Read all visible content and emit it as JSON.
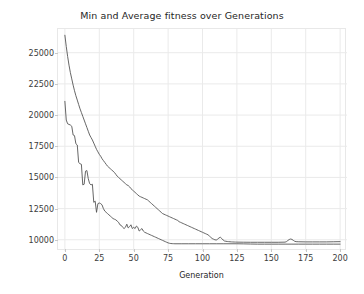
{
  "chart_data": {
    "type": "line",
    "title": "Min and Average fitness over Generations",
    "xlabel": "Generation",
    "ylabel": "Min / Average Fitness",
    "xlim": [
      -5,
      205
    ],
    "ylim": [
      9100,
      26900
    ],
    "xticks": [
      0,
      25,
      50,
      75,
      100,
      125,
      150,
      175,
      200
    ],
    "xticklabels": [
      "0",
      "25",
      "50",
      "75",
      "100",
      "125",
      "150",
      "175",
      "200"
    ],
    "yticks": [
      10000,
      12500,
      15000,
      17500,
      20000,
      22500,
      25000
    ],
    "yticklabels": [
      "10000",
      "12500",
      "15000",
      "17500",
      "20000",
      "22500",
      "25000"
    ],
    "grid": true,
    "grid_color": "#eaeaea",
    "legend": null,
    "line_color": "#555555",
    "line_width": 0.9,
    "series": [
      {
        "name": "Average Fitness",
        "x": [
          0,
          1,
          2,
          3,
          4,
          5,
          6,
          7,
          8,
          9,
          10,
          11,
          12,
          13,
          14,
          15,
          16,
          17,
          18,
          19,
          20,
          21,
          22,
          23,
          24,
          25,
          26,
          27,
          28,
          29,
          30,
          31,
          32,
          33,
          34,
          35,
          36,
          37,
          38,
          39,
          40,
          41,
          42,
          43,
          44,
          45,
          46,
          47,
          48,
          49,
          50,
          51,
          52,
          53,
          54,
          55,
          56,
          57,
          58,
          59,
          60,
          61,
          62,
          63,
          64,
          65,
          66,
          67,
          68,
          69,
          70,
          71,
          72,
          73,
          74,
          75,
          76,
          77,
          78,
          79,
          80,
          81,
          82,
          83,
          84,
          85,
          86,
          87,
          88,
          89,
          90,
          91,
          92,
          93,
          94,
          95,
          96,
          97,
          98,
          99,
          100,
          101,
          102,
          103,
          104,
          105,
          106,
          107,
          108,
          109,
          110,
          111,
          112,
          113,
          114,
          115,
          116,
          117,
          118,
          119,
          120,
          121,
          122,
          123,
          124,
          125,
          130,
          135,
          140,
          145,
          150,
          155,
          160,
          161,
          162,
          163,
          164,
          165,
          166,
          167,
          168,
          170,
          175,
          180,
          185,
          190,
          195,
          200
        ],
        "y": [
          26400,
          25500,
          24700,
          24000,
          23400,
          22900,
          22400,
          21950,
          21550,
          21200,
          20850,
          20500,
          20200,
          19900,
          19600,
          19300,
          19000,
          18700,
          18400,
          18200,
          18000,
          17750,
          17500,
          17250,
          17050,
          16850,
          16700,
          16500,
          16350,
          16200,
          16050,
          15900,
          15800,
          15700,
          15600,
          15500,
          15400,
          15250,
          15100,
          15000,
          14900,
          14800,
          14700,
          14600,
          14500,
          14400,
          14350,
          14250,
          14100,
          14000,
          13900,
          13800,
          13700,
          13600,
          13500,
          13450,
          13400,
          13350,
          13300,
          13250,
          13200,
          13100,
          13000,
          12900,
          12800,
          12700,
          12600,
          12500,
          12400,
          12300,
          12200,
          12100,
          12050,
          12000,
          11950,
          11900,
          11850,
          11800,
          11750,
          11700,
          11650,
          11600,
          11550,
          11450,
          11400,
          11350,
          11300,
          11250,
          11200,
          11150,
          11100,
          11050,
          11000,
          10950,
          10900,
          10850,
          10800,
          10750,
          10700,
          10650,
          10600,
          10550,
          10500,
          10450,
          10400,
          10300,
          10200,
          10100,
          10050,
          10000,
          9980,
          10050,
          10150,
          10200,
          10100,
          9980,
          9900,
          9880,
          9860,
          9850,
          9840,
          9830,
          9825,
          9820,
          9815,
          9810,
          9805,
          9800,
          9800,
          9800,
          9800,
          9800,
          9810,
          9850,
          9940,
          10020,
          10060,
          10030,
          9950,
          9880,
          9850,
          9840,
          9830,
          9830,
          9830,
          9830,
          9840,
          9850
        ],
        "estimated": true
      },
      {
        "name": "Min Fitness",
        "x": [
          0,
          1,
          2,
          3,
          4,
          5,
          6,
          7,
          8,
          9,
          10,
          11,
          12,
          13,
          14,
          15,
          16,
          17,
          18,
          19,
          20,
          21,
          22,
          23,
          24,
          25,
          26,
          27,
          28,
          29,
          30,
          31,
          32,
          33,
          34,
          35,
          36,
          37,
          38,
          39,
          40,
          41,
          42,
          43,
          44,
          45,
          46,
          47,
          48,
          49,
          50,
          51,
          52,
          53,
          54,
          55,
          56,
          57,
          58,
          59,
          60,
          61,
          62,
          63,
          64,
          65,
          66,
          67,
          68,
          69,
          70,
          71,
          72,
          73,
          74,
          75,
          76,
          77,
          78,
          79,
          80,
          85,
          90,
          95,
          100,
          105,
          110,
          115,
          120,
          125,
          130,
          135,
          140,
          145,
          150,
          155,
          160,
          165,
          170,
          175,
          180,
          185,
          190,
          195,
          200
        ],
        "y": [
          21100,
          19600,
          19300,
          19250,
          19200,
          19100,
          18400,
          18350,
          17700,
          17600,
          16200,
          16100,
          16050,
          14400,
          14450,
          15500,
          15550,
          14900,
          14500,
          14400,
          14450,
          13000,
          13100,
          12200,
          12900,
          12950,
          12900,
          12800,
          12500,
          12300,
          12200,
          12100,
          12000,
          11900,
          11800,
          11700,
          11650,
          11600,
          11500,
          11400,
          11200,
          11150,
          11000,
          10900,
          11000,
          11250,
          10950,
          11050,
          11200,
          10900,
          11000,
          10900,
          11100,
          11000,
          10700,
          10800,
          10900,
          10700,
          10600,
          10550,
          10500,
          10450,
          10400,
          10350,
          10300,
          10250,
          10200,
          10150,
          10100,
          10050,
          10000,
          9950,
          9900,
          9850,
          9800,
          9750,
          9720,
          9700,
          9690,
          9685,
          9680,
          9680,
          9680,
          9680,
          9680,
          9680,
          9680,
          9680,
          9680,
          9680,
          9670,
          9660,
          9650,
          9650,
          9650,
          9650,
          9650,
          9650,
          9650,
          9650,
          9650,
          9650,
          9650,
          9650,
          9650
        ],
        "estimated": true
      }
    ]
  }
}
